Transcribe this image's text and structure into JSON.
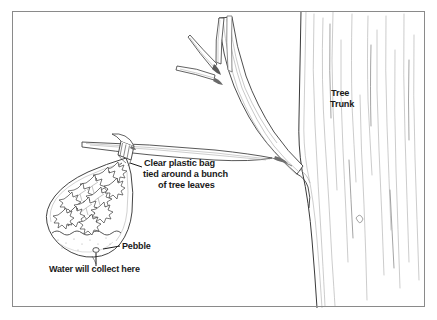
{
  "figure": {
    "background_color": "#ffffff",
    "frame": {
      "name": "illustration-border",
      "color": "#8a8a8a",
      "x": 12,
      "y": 11,
      "width": 413,
      "height": 296
    },
    "ink_color": "#2b2b2b",
    "text_color": "#1a1a1a"
  },
  "labels": {
    "tree_trunk": {
      "lines": [
        "Tree",
        "Trunk"
      ],
      "line1": "Tree",
      "line2": "Trunk",
      "x": 331,
      "y": 96
    },
    "plastic_bag": {
      "lines": [
        "Clear plastic bag",
        "tied around a bunch",
        "of tree leaves"
      ],
      "line1": "Clear plastic bag",
      "line2": "tied around a bunch",
      "line3": "of tree leaves",
      "x": 144,
      "y": 163
    },
    "pebble": {
      "text": "Pebble",
      "x": 122,
      "y": 249
    },
    "water_collect": {
      "text": "Water will collect here",
      "x": 49,
      "y": 272
    }
  },
  "elements": {
    "tree_trunk": "tree-trunk",
    "branch": "tree-branch",
    "bag": "clear-plastic-bag",
    "leaves": "tree-leaves-bunch",
    "tie": "bag-twist-tie",
    "water": "collected-water",
    "pebble": "pebble",
    "leader_bag": "leader-line-bag",
    "leader_pebble": "leader-line-pebble",
    "leader_water": "leader-line-water"
  }
}
